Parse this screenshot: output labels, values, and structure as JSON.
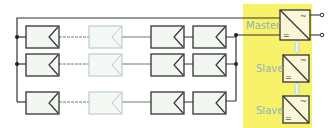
{
  "diagram": {
    "colors": {
      "inverter_area": "#f7f26a",
      "panel_fill": "#f2f7f2",
      "panel_stroke": "#333333",
      "faded_stroke": "#b9c9c9",
      "label": "#8fb3b3",
      "link_arrow": "#bfe0e6"
    },
    "strings": [
      {
        "name": "string-1",
        "panels": 4
      },
      {
        "name": "string-2",
        "panels": 4
      },
      {
        "name": "string-3",
        "panels": 4
      }
    ],
    "inverters": [
      {
        "role": "Master",
        "ac_symbol": "~",
        "dc_symbol": "="
      },
      {
        "role": "Slave",
        "ac_symbol": "~",
        "dc_symbol": "="
      },
      {
        "role": "Slave",
        "ac_symbol": "~",
        "dc_symbol": "="
      }
    ]
  }
}
